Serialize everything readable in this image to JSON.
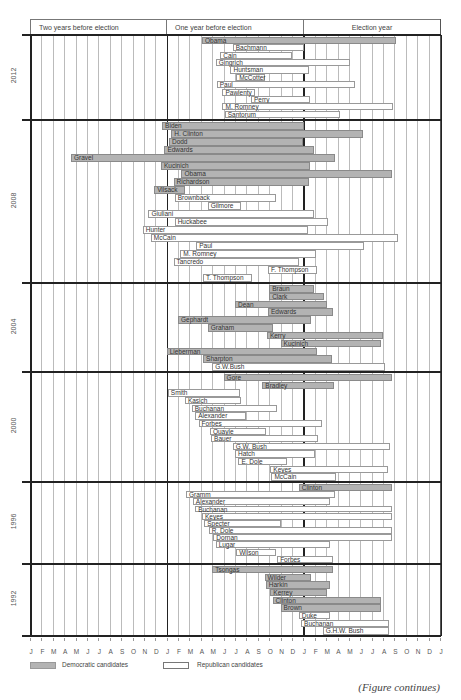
{
  "chart_data": {
    "type": "gantt",
    "title": "",
    "header": {
      "periods": [
        "Two years before election",
        "One year before election",
        "Election year"
      ]
    },
    "x_axis": {
      "months": [
        "J",
        "F",
        "M",
        "A",
        "M",
        "J",
        "J",
        "A",
        "S",
        "O",
        "N",
        "D",
        "J",
        "F",
        "M",
        "A",
        "M",
        "J",
        "J",
        "A",
        "S",
        "O",
        "N",
        "D",
        "J",
        "F",
        "M",
        "A",
        "M",
        "J",
        "J",
        "A",
        "S",
        "O",
        "N",
        "D",
        "J"
      ],
      "unit": "month",
      "range": [
        0,
        36
      ],
      "note": "0 = January two years before election; 24 = January of election year"
    },
    "legend": [
      {
        "label": "Democratic candidates",
        "party": "dem",
        "color": "#b3b3b3"
      },
      {
        "label": "Republican candidates",
        "party": "rep",
        "color": "#ffffff"
      }
    ],
    "sections": [
      {
        "year": "2012",
        "y_top": 35,
        "y_bottom": 119,
        "candidates": [
          {
            "name": "Obama",
            "party": "dem",
            "start": 15.1,
            "end": 32.1
          },
          {
            "name": "Bachmann",
            "party": "rep",
            "start": 17.8,
            "end": 24.1
          },
          {
            "name": "Cain",
            "party": "rep",
            "start": 16.7,
            "end": 23.0
          },
          {
            "name": "Gingrich",
            "party": "rep",
            "start": 16.3,
            "end": 28.1
          },
          {
            "name": "Huntsman",
            "party": "rep",
            "start": 17.6,
            "end": 24.5
          },
          {
            "name": "McCotter",
            "party": "rep",
            "start": 18.1,
            "end": 20.6
          },
          {
            "name": "Paul",
            "party": "rep",
            "start": 16.4,
            "end": 28.5
          },
          {
            "name": "Pawlenty",
            "party": "rep",
            "start": 16.9,
            "end": 19.8
          },
          {
            "name": "Perry",
            "party": "rep",
            "start": 19.4,
            "end": 24.6
          },
          {
            "name": "M. Romney",
            "party": "rep",
            "start": 16.9,
            "end": 31.9
          },
          {
            "name": "Santorum",
            "party": "rep",
            "start": 17.1,
            "end": 27.2
          }
        ]
      },
      {
        "year": "2008",
        "y_top": 120,
        "y_bottom": 283,
        "candidates": [
          {
            "name": "Biden",
            "party": "dem",
            "start": 11.6,
            "end": 24.1
          },
          {
            "name": "H. Clinton",
            "party": "dem",
            "start": 12.4,
            "end": 29.2
          },
          {
            "name": "Dodd",
            "party": "dem",
            "start": 12.2,
            "end": 24.0
          },
          {
            "name": "Edwards",
            "party": "dem",
            "start": 11.8,
            "end": 24.9
          },
          {
            "name": "Gravel",
            "party": "dem",
            "start": 3.6,
            "end": 26.8
          },
          {
            "name": "Kucinich",
            "party": "dem",
            "start": 11.5,
            "end": 24.6
          },
          {
            "name": "Obama",
            "party": "dem",
            "start": 13.3,
            "end": 31.8
          },
          {
            "name": "Richardson",
            "party": "dem",
            "start": 12.6,
            "end": 24.5
          },
          {
            "name": "Vilsack",
            "party": "dem",
            "start": 10.9,
            "end": 13.6
          },
          {
            "name": "Brownback",
            "party": "rep",
            "start": 12.7,
            "end": 21.6
          },
          {
            "name": "Gilmore",
            "party": "rep",
            "start": 15.6,
            "end": 18.5
          },
          {
            "name": "Giuliani",
            "party": "rep",
            "start": 10.4,
            "end": 24.9
          },
          {
            "name": "Huckabee",
            "party": "rep",
            "start": 12.7,
            "end": 26.2
          },
          {
            "name": "Hunter",
            "party": "rep",
            "start": 9.9,
            "end": 24.4
          },
          {
            "name": "McCain",
            "party": "rep",
            "start": 10.6,
            "end": 32.3
          },
          {
            "name": "Paul",
            "party": "rep",
            "start": 14.6,
            "end": 29.3
          },
          {
            "name": "M. Romney",
            "party": "rep",
            "start": 13.2,
            "end": 25.1
          },
          {
            "name": "Tancredo",
            "party": "rep",
            "start": 12.6,
            "end": 23.6
          },
          {
            "name": "F. Thompson",
            "party": "rep",
            "start": 20.9,
            "end": 25.2
          },
          {
            "name": "T. Thompson",
            "party": "rep",
            "start": 15.2,
            "end": 19.5
          }
        ]
      },
      {
        "year": "2004",
        "y_top": 283,
        "y_bottom": 372,
        "candidates": [
          {
            "name": "Braun",
            "party": "dem",
            "start": 21.0,
            "end": 24.9
          },
          {
            "name": "Clark",
            "party": "dem",
            "start": 21.0,
            "end": 25.8
          },
          {
            "name": "Dean",
            "party": "dem",
            "start": 18.0,
            "end": 26.1
          },
          {
            "name": "Edwards",
            "party": "dem",
            "start": 20.9,
            "end": 26.6
          },
          {
            "name": "Gephardt",
            "party": "dem",
            "start": 13.0,
            "end": 24.7
          },
          {
            "name": "Graham",
            "party": "dem",
            "start": 15.6,
            "end": 21.3
          },
          {
            "name": "Kerry",
            "party": "dem",
            "start": 20.8,
            "end": 31.0
          },
          {
            "name": "Kucinich",
            "party": "dem",
            "start": 22.0,
            "end": 30.8
          },
          {
            "name": "Lieberman",
            "party": "dem",
            "start": 12.0,
            "end": 25.2
          },
          {
            "name": "Sharpton",
            "party": "dem",
            "start": 15.2,
            "end": 26.5
          },
          {
            "name": "G.W.Bush",
            "party": "rep",
            "start": 16.0,
            "end": 31.2
          }
        ]
      },
      {
        "year": "2000",
        "y_top": 372,
        "y_bottom": 482,
        "candidates": [
          {
            "name": "Gore",
            "party": "dem",
            "start": 17.0,
            "end": 31.8
          },
          {
            "name": "Bradley",
            "party": "dem",
            "start": 20.4,
            "end": 26.7
          },
          {
            "name": "Smith",
            "party": "rep",
            "start": 12.1,
            "end": 18.4
          },
          {
            "name": "Kasich",
            "party": "rep",
            "start": 13.6,
            "end": 18.5
          },
          {
            "name": "Buchanan",
            "party": "rep",
            "start": 14.2,
            "end": 21.7
          },
          {
            "name": "Alexander",
            "party": "rep",
            "start": 14.5,
            "end": 19.0
          },
          {
            "name": "Forbes",
            "party": "rep",
            "start": 14.8,
            "end": 25.6
          },
          {
            "name": "Quayle",
            "party": "rep",
            "start": 15.8,
            "end": 20.7
          },
          {
            "name": "Bauer",
            "party": "rep",
            "start": 15.9,
            "end": 25.3
          },
          {
            "name": "G.W. Bush",
            "party": "rep",
            "start": 17.8,
            "end": 31.6
          },
          {
            "name": "Hatch",
            "party": "rep",
            "start": 18.0,
            "end": 25.0
          },
          {
            "name": "E. Dole",
            "party": "rep",
            "start": 18.3,
            "end": 22.6
          },
          {
            "name": "Keyes",
            "party": "rep",
            "start": 21.1,
            "end": 31.4
          },
          {
            "name": "McCain",
            "party": "rep",
            "start": 21.2,
            "end": 26.9
          }
        ]
      },
      {
        "year": "1996",
        "y_top": 482,
        "y_bottom": 564,
        "candidates": [
          {
            "name": "Clinton",
            "party": "dem",
            "start": 23.6,
            "end": 31.8
          },
          {
            "name": "Gramm",
            "party": "rep",
            "start": 13.7,
            "end": 26.8
          },
          {
            "name": "Alexander",
            "party": "rep",
            "start": 14.3,
            "end": 26.3
          },
          {
            "name": "Buchanan",
            "party": "rep",
            "start": 14.5,
            "end": 31.8
          },
          {
            "name": "Keyes",
            "party": "rep",
            "start": 15.1,
            "end": 31.8
          },
          {
            "name": "Specter",
            "party": "rep",
            "start": 15.3,
            "end": 22.0
          },
          {
            "name": "R. Dole",
            "party": "rep",
            "start": 15.7,
            "end": 31.8
          },
          {
            "name": "Dornan",
            "party": "rep",
            "start": 16.1,
            "end": 31.8
          },
          {
            "name": "Lugar",
            "party": "rep",
            "start": 16.3,
            "end": 26.3
          },
          {
            "name": "Wilson",
            "party": "rep",
            "start": 18.1,
            "end": 21.6
          },
          {
            "name": "Forbes",
            "party": "rep",
            "start": 21.7,
            "end": 26.6
          }
        ]
      },
      {
        "year": "1992",
        "y_top": 564,
        "y_bottom": 636,
        "candidates": [
          {
            "name": "Tsongas",
            "party": "dem",
            "start": 16.0,
            "end": 26.6
          },
          {
            "name": "Wilder",
            "party": "dem",
            "start": 20.6,
            "end": 24.7
          },
          {
            "name": "Harkin",
            "party": "dem",
            "start": 20.7,
            "end": 26.3
          },
          {
            "name": "Kerrey",
            "party": "dem",
            "start": 21.1,
            "end": 26.1
          },
          {
            "name": "Clinton",
            "party": "dem",
            "start": 21.3,
            "end": 30.8
          },
          {
            "name": "Brown",
            "party": "dem",
            "start": 22.0,
            "end": 30.8
          },
          {
            "name": "Duke",
            "party": "rep",
            "start": 23.6,
            "end": 26.3
          },
          {
            "name": "Buchanan",
            "party": "rep",
            "start": 23.8,
            "end": 31.5
          },
          {
            "name": "G.H.W. Bush",
            "party": "rep",
            "start": 25.7,
            "end": 31.5
          }
        ]
      }
    ],
    "grid": true
  },
  "footer": {
    "note": "(Figure continues)"
  }
}
